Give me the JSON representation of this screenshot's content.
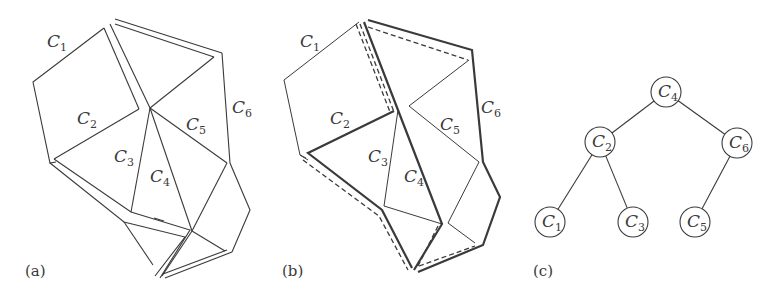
{
  "figure": {
    "stroke_color": "#3a3a3a",
    "background": "#ffffff",
    "panels": [
      {
        "id": "a",
        "caption": "(a)",
        "caption_pos": [
          25,
          276
        ],
        "description": "Polygon partitioned into cells C1..C6, with double lines marking the separator",
        "labels": [
          {
            "text": "C",
            "sub": "1",
            "pos": [
              47,
              47
            ]
          },
          {
            "text": "C",
            "sub": "2",
            "pos": [
              77,
              124
            ]
          },
          {
            "text": "C",
            "sub": "3",
            "pos": [
              114,
              162
            ]
          },
          {
            "text": "C",
            "sub": "4",
            "pos": [
              150,
              182
            ]
          },
          {
            "text": "C",
            "sub": "5",
            "pos": [
              186,
              130
            ]
          },
          {
            "text": "C",
            "sub": "6",
            "pos": [
              232,
              113
            ]
          }
        ],
        "single_lines": [
          [
            [
              104,
              28
            ],
            [
              33,
              82
            ],
            [
              50,
              163
            ],
            [
              56,
              162
            ]
          ],
          [
            [
              139,
              109
            ],
            [
              54,
              159
            ]
          ],
          [
            [
              214,
              57
            ],
            [
              150,
              108
            ]
          ],
          [
            [
              150,
              108
            ],
            [
              131,
              212
            ]
          ],
          [
            [
              150,
              108
            ],
            [
              192,
              231
            ]
          ],
          [
            [
              150,
              108
            ],
            [
              227,
              163
            ]
          ],
          [
            [
              227,
              163
            ],
            [
              192,
              231
            ]
          ],
          [
            [
              192,
              231
            ],
            [
              225,
              251
            ]
          ],
          [
            [
              222,
              53
            ],
            [
              230,
              163
            ],
            [
              250,
              210
            ],
            [
              232,
              252
            ]
          ],
          [
            [
              164,
              221
            ],
            [
              154,
              218
            ]
          ],
          [
            [
              124,
              222
            ],
            [
              153,
              265
            ]
          ]
        ],
        "double_lines": [
          [
            [
              104,
              28
            ],
            [
              139,
              109
            ]
          ],
          [
            [
              110,
              24
            ],
            [
              150,
              108
            ]
          ],
          [
            [
              115,
              19
            ],
            [
              222,
              53
            ]
          ],
          [
            [
              115,
              24
            ],
            [
              214,
              57
            ]
          ],
          [
            [
              50,
              163
            ],
            [
              124,
              222
            ],
            [
              185,
              237
            ],
            [
              155,
              276
            ]
          ],
          [
            [
              54,
              159
            ],
            [
              131,
              212
            ],
            [
              190,
              230
            ],
            [
              160,
              278
            ]
          ],
          [
            [
              165,
              278
            ],
            [
              232,
              252
            ]
          ],
          [
            [
              163,
              274
            ],
            [
              227,
              250
            ]
          ],
          [
            [
              192,
              231
            ],
            [
              162,
              276
            ]
          ]
        ]
      },
      {
        "id": "b",
        "caption": "(b)",
        "caption_pos": [
          282,
          276
        ],
        "description": "Same partition; thick solid and dashed lines show two separator paths",
        "labels": [
          {
            "text": "C",
            "sub": "1",
            "pos": [
              300,
              47
            ]
          },
          {
            "text": "C",
            "sub": "2",
            "pos": [
              330,
              124
            ]
          },
          {
            "text": "C",
            "sub": "3",
            "pos": [
              368,
              162
            ]
          },
          {
            "text": "C",
            "sub": "4",
            "pos": [
              404,
              182
            ]
          },
          {
            "text": "C",
            "sub": "5",
            "pos": [
              440,
              130
            ]
          },
          {
            "text": "C",
            "sub": "6",
            "pos": [
              481,
              113
            ]
          }
        ],
        "thin_lines": [
          [
            [
              359,
              22
            ],
            [
              284,
              80
            ],
            [
              300,
              155
            ],
            [
              308,
              160
            ]
          ],
          [
            [
              469,
              60
            ],
            [
              409,
              106
            ]
          ],
          [
            [
              409,
              106
            ],
            [
              479,
              162
            ],
            [
              448,
              223
            ],
            [
              475,
              243
            ]
          ],
          [
            [
              398,
              110
            ],
            [
              384,
              206
            ],
            [
              442,
              224
            ]
          ],
          [
            [
              300,
              155
            ],
            [
              306,
              158
            ]
          ]
        ],
        "thick_lines": [
          [
            [
              368,
              20
            ],
            [
              472,
              50
            ],
            [
              483,
              162
            ],
            [
              500,
              197
            ],
            [
              483,
              245
            ],
            [
              418,
              272
            ]
          ],
          [
            [
              364,
              22
            ],
            [
              442,
              224
            ],
            [
              414,
              270
            ]
          ],
          [
            [
              394,
              111
            ],
            [
              308,
              153
            ],
            [
              382,
              210
            ],
            [
              412,
              268
            ]
          ]
        ],
        "dashed_lines": [
          [
            [
              368,
              27
            ],
            [
              468,
              60
            ]
          ],
          [
            [
              360,
              24
            ],
            [
              394,
              112
            ]
          ],
          [
            [
              356,
              24
            ],
            [
              390,
              112
            ]
          ],
          [
            [
              303,
              160
            ],
            [
              379,
              216
            ],
            [
              408,
              270
            ]
          ],
          [
            [
              438,
              226
            ],
            [
              418,
              266
            ]
          ],
          [
            [
              419,
              266
            ],
            [
              475,
              246
            ]
          ]
        ]
      },
      {
        "id": "c",
        "caption": "(c)",
        "caption_pos": [
          533,
          276
        ],
        "description": "Binary tree of cells",
        "nodes": [
          {
            "id": "C4",
            "text": "C",
            "sub": "4",
            "pos": [
              666,
              92
            ]
          },
          {
            "id": "C2",
            "text": "C",
            "sub": "2",
            "pos": [
              600,
              142
            ]
          },
          {
            "id": "C6",
            "text": "C",
            "sub": "6",
            "pos": [
              737,
              143
            ]
          },
          {
            "id": "C1",
            "text": "C",
            "sub": "1",
            "pos": [
              550,
              222
            ]
          },
          {
            "id": "C3",
            "text": "C",
            "sub": "3",
            "pos": [
              633,
              222
            ]
          },
          {
            "id": "C5",
            "text": "C",
            "sub": "5",
            "pos": [
              695,
              222
            ]
          }
        ],
        "node_radius": 15,
        "edges": [
          [
            "C4",
            "C2"
          ],
          [
            "C4",
            "C6"
          ],
          [
            "C2",
            "C1"
          ],
          [
            "C2",
            "C3"
          ],
          [
            "C6",
            "C5"
          ]
        ]
      }
    ]
  }
}
